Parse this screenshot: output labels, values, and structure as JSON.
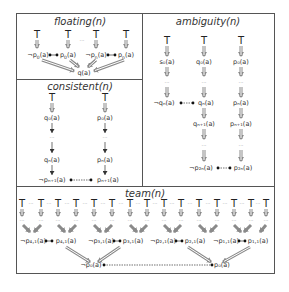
{
  "panels": {
    "floating": {
      "title": "floating(n)",
      "top_symbol": "T",
      "ellipsis": "···",
      "pairs": [
        {
          "neg": "¬p",
          "neg_sub": "0",
          "pos": "p",
          "pos_sub": "0"
        },
        {
          "neg": "¬p",
          "neg_sub": "n",
          "pos": "p",
          "pos_sub": "n"
        }
      ],
      "target": "q(a)"
    },
    "ambiguity": {
      "title": "ambiguity(n)",
      "top_symbol": "T",
      "ellipsis": "···",
      "columns": [
        {
          "rows": [
            "s₀(a)",
            "···",
            "¬qₙ(a)"
          ]
        },
        {
          "rows": [
            "q₀(a)",
            "···",
            "qₙ(a)",
            "qₙ₊₁(a)",
            "···",
            "¬p₂ₙ(a)"
          ]
        },
        {
          "rows": [
            "p₀(a)",
            "···",
            "pₙ(a)",
            "pₙ₊₁(a)",
            "···",
            "p₂ₙ(a)"
          ]
        }
      ],
      "labels": {
        "s0": "s₀(a)",
        "q0": "q₀(a)",
        "p0": "p₀(a)",
        "neg_qn": "¬qₙ(a)",
        "qn": "qₙ(a)",
        "pn": "pₙ(a)",
        "qn1": "qₙ₊₁(a)",
        "pn1": "pₙ₊₁(a)",
        "neg_p2n": "¬p₂ₙ(a)",
        "p2n": "p₂ₙ(a)"
      }
    },
    "consistent": {
      "title": "consistent(n)",
      "top_symbol": "T",
      "ellipsis": "···",
      "labels": {
        "q0": "q₀(a)",
        "p0": "p₀(a)",
        "qn": "qₙ(a)",
        "pn": "pₙ(a)",
        "neg_pn1": "¬pₙ₊₁(a)",
        "pn1": "pₙ₊₁(a)"
      }
    },
    "team": {
      "title": "team(n)",
      "top_symbol": "T",
      "ellipsis": "···",
      "pairs": [
        {
          "neg": "¬p₄,₁(a)",
          "pos": "p₄,₁(a)"
        },
        {
          "neg": "¬p₃,₁(a)",
          "pos": "p₃,₁(a)"
        },
        {
          "neg": "¬p₂,₁(a)",
          "pos": "p₂,₁(a)"
        },
        {
          "neg": "¬p₁,₁(a)",
          "pos": "p₁,₁(a)"
        }
      ],
      "bottom": {
        "neg": "¬p₀(a)",
        "pos": "p₀(a)"
      }
    }
  },
  "colors": {
    "frame": "#555555",
    "double_arrow": "#8a8a8a",
    "text": "#333333"
  }
}
